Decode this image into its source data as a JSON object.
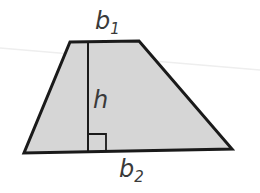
{
  "diagram": {
    "shape": "trapezoid",
    "fill_color": "#d6d6d6",
    "stroke_color": "#1a1a1a",
    "labels": {
      "top_base": {
        "main": "b",
        "sub": "1"
      },
      "bottom_base": {
        "main": "b",
        "sub": "2"
      },
      "height": "h"
    },
    "vertices": {
      "top_left": [
        70,
        42
      ],
      "top_right": [
        139,
        41
      ],
      "bottom_right": [
        232,
        149
      ],
      "bottom_left": [
        24,
        153
      ]
    }
  }
}
